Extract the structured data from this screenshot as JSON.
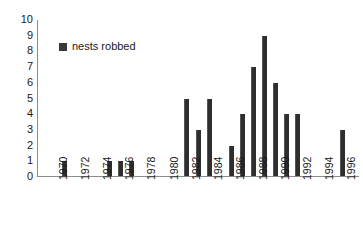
{
  "chart_data": {
    "type": "bar",
    "title": "",
    "xlabel": "",
    "ylabel": "",
    "ylim": [
      0,
      10
    ],
    "ytick_labels": [
      "10",
      "9",
      "8",
      "7",
      "6",
      "5",
      "4",
      "3",
      "2",
      "1",
      "0"
    ],
    "xtick_labels": [
      "1970",
      "1972",
      "1974",
      "1976",
      "1978",
      "1980",
      "1982",
      "1984",
      "1986",
      "1988",
      "1990",
      "1992",
      "1994",
      "1996"
    ],
    "grid": false,
    "legend_position": "upper-left-inside",
    "legend": [
      {
        "name": "nests robbed",
        "color": "#2e2e2e"
      }
    ],
    "categories": [
      1970,
      1971,
      1972,
      1973,
      1974,
      1975,
      1976,
      1977,
      1978,
      1979,
      1980,
      1981,
      1982,
      1983,
      1984,
      1985,
      1986,
      1987,
      1988,
      1989,
      1990,
      1991,
      1992,
      1993,
      1994,
      1995,
      1996
    ],
    "series": [
      {
        "name": "nests robbed",
        "values": [
          0,
          1,
          0,
          0,
          0,
          1,
          1,
          1,
          0,
          0,
          0,
          0,
          5,
          3,
          5,
          0,
          2,
          4,
          7,
          9,
          6,
          4,
          4,
          0,
          0,
          0,
          3
        ]
      }
    ]
  },
  "legend": {
    "swatch_name": "legend-color-swatch",
    "label": "nests robbed"
  },
  "colors": {
    "bar": "#2e2e2e",
    "axis": "#8c8c8c",
    "text": "#1a1a1a",
    "background": "#ffffff"
  }
}
